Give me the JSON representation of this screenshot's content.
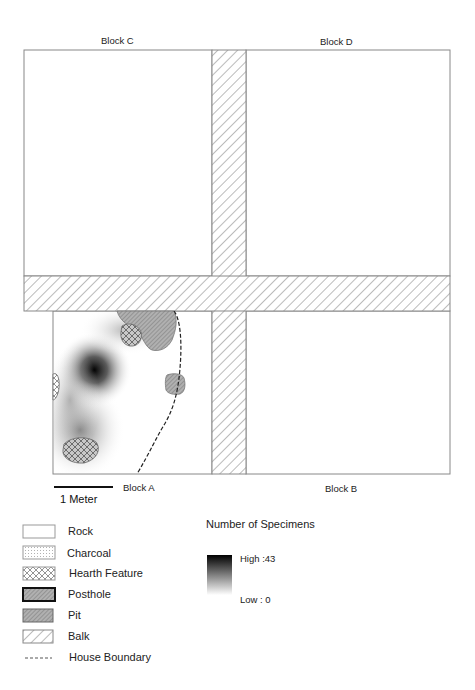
{
  "blocks": {
    "c": "Block C",
    "d": "Block D",
    "a": "Block A",
    "b": "Block B"
  },
  "scale_bar": {
    "label": "1 Meter"
  },
  "legend": {
    "items": [
      {
        "label": "Rock",
        "symbol": "rock"
      },
      {
        "label": "Charcoal",
        "symbol": "charcoal"
      },
      {
        "label": "Hearth Feature",
        "symbol": "hearth-feature"
      },
      {
        "label": "Posthole",
        "symbol": "posthole"
      },
      {
        "label": "Pit",
        "symbol": "pit"
      },
      {
        "label": "Balk",
        "symbol": "balk"
      },
      {
        "label": "House Boundary",
        "symbol": "house-boundary"
      }
    ]
  },
  "density_legend": {
    "title": "Number of Specimens",
    "high": "High :43",
    "low": "Low : 0"
  },
  "colors": {
    "balk_hatch": "#777777",
    "pit_fill": "#a9a9a9",
    "density_max": "#000000",
    "border": "#888888"
  }
}
